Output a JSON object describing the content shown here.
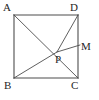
{
  "figure": {
    "shape": "square",
    "stroke_color": "#4d4d4d",
    "label_color": "#262626",
    "background_color": "#ffffff",
    "square": {
      "corners": {
        "A": {
          "x": 14,
          "y": 15,
          "label": "A"
        },
        "D": {
          "x": 78,
          "y": 15,
          "label": "D"
        },
        "C": {
          "x": 78,
          "y": 78,
          "label": "C"
        },
        "B": {
          "x": 14,
          "y": 78,
          "label": "B"
        }
      }
    },
    "points": [
      {
        "name": "P",
        "label": "P",
        "x": 57,
        "y": 52,
        "location": "interior-intersection"
      },
      {
        "name": "M",
        "label": "M",
        "x": 78,
        "y": 46,
        "location": "on-side-DC"
      }
    ],
    "segments": [
      {
        "name": "side-AD",
        "from": "A",
        "to": "D"
      },
      {
        "name": "side-DC",
        "from": "D",
        "to": "C"
      },
      {
        "name": "side-CB",
        "from": "C",
        "to": "B"
      },
      {
        "name": "side-BA",
        "from": "B",
        "to": "A"
      },
      {
        "name": "diagonal-AC",
        "from": "A",
        "to": "C"
      },
      {
        "name": "segment-DP",
        "from": "D",
        "to": "P"
      },
      {
        "name": "segment-PB",
        "from": "P",
        "to": "B"
      },
      {
        "name": "segment-PM",
        "from": "P",
        "to": "M"
      }
    ],
    "labels": {
      "A": "A",
      "B": "B",
      "C": "C",
      "D": "D",
      "M": "M",
      "P": "P"
    }
  }
}
